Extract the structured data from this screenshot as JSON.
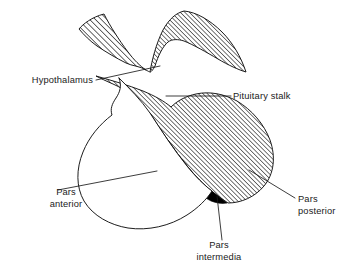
{
  "figure": {
    "background_color": "#ffffff",
    "line_color": "#111111",
    "text_color": "#1a1a1a",
    "hatch_angle_degrees": 45
  },
  "labels": {
    "hypothalamus": {
      "text": "Hypothalamus",
      "anchor": "end",
      "x": 93,
      "y": 83
    },
    "pituitary_stalk": {
      "text": "Pituitary stalk",
      "anchor": "start",
      "x": 233,
      "y": 99
    },
    "pars_anterior": {
      "line1": "Pars",
      "line2": "anterior",
      "anchor": "middle",
      "x": 66,
      "y": 195
    },
    "pars_posterior": {
      "line1": "Pars",
      "line2": "posterior",
      "anchor": "start",
      "x": 298,
      "y": 202
    },
    "pars_intermedia": {
      "line1": "Pars",
      "line2": "intermedia",
      "anchor": "middle",
      "x": 219,
      "y": 248
    }
  },
  "regions": {
    "hypothalamus_region": "hatched",
    "pituitary_stalk_region": "hatched",
    "pars_posterior_region": "hatched",
    "pars_intermedia_region": "solid-black",
    "pars_anterior_region": "white-outline"
  }
}
